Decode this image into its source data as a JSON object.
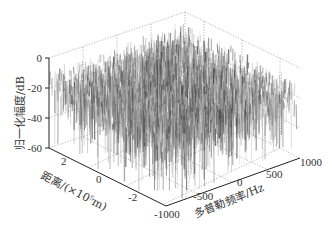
{
  "chart_data": {
    "type": "surface3d",
    "title": "",
    "xlabel": "多普勒频率/Hz",
    "ylabel": "距离/(×10⁵m)",
    "zlabel": "归一化幅度/dB",
    "x_ticks": [
      -1000,
      -500,
      0,
      500,
      1000
    ],
    "y_ticks": [
      2,
      0,
      -2
    ],
    "z_ticks": [
      0,
      -20,
      -40,
      -60
    ],
    "xlim": [
      -1000,
      1000
    ],
    "ylim": [
      -3,
      3
    ],
    "zlim": [
      -70,
      0
    ],
    "grid": true,
    "colormap": "gray"
  },
  "labels": {
    "z_axis": "归一化幅度/dB",
    "y_axis": "距离/(×10⁵m)",
    "x_axis": "多普勒频率/Hz",
    "z_ticks": [
      "0",
      "-20",
      "-40",
      "-60"
    ],
    "y_ticks": [
      "2",
      "0",
      "-2"
    ],
    "x_ticks": [
      "-1000",
      "-500",
      "0",
      "500",
      "1000"
    ]
  }
}
